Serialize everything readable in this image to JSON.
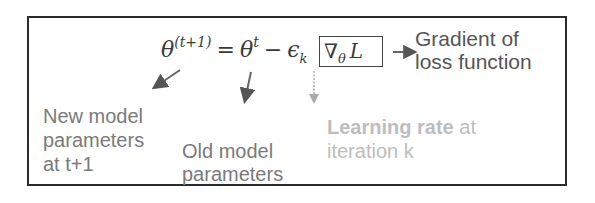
{
  "diagram": {
    "equation": {
      "lhs_symbol": "θ",
      "lhs_superscript": "(t+1)",
      "equals": "=",
      "term1_symbol": "θ",
      "term1_superscript": "t",
      "minus": "−",
      "learning_rate_symbol": "ϵ",
      "learning_rate_subscript": "k",
      "gradient_nabla": "∇",
      "gradient_subscript": "θ",
      "gradient_loss": "L"
    },
    "annotations": {
      "gradient": {
        "line1": "Gradient of",
        "line2": "loss function",
        "color": "#555555"
      },
      "new_params": {
        "line1": "New model",
        "line2": "parameters",
        "line3": "at t+1",
        "color": "#7a7a7a"
      },
      "old_params": {
        "line1": "Old model",
        "line2": "parameters",
        "color": "#7a7a7a"
      },
      "learning_rate": {
        "line1_bold": "Learning rate",
        "line1_rest": " at",
        "line2": "iteration k",
        "color": "#bdbdbd"
      }
    },
    "colors": {
      "frame": "#2b2b2b",
      "equation": "#3a3a3a",
      "arrow_dark": "#555555",
      "arrow_light": "#aaaaaa"
    }
  }
}
